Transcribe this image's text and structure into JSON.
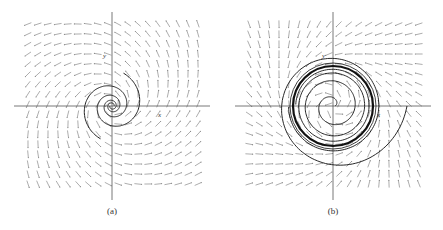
{
  "figure": {
    "panels": [
      {
        "id": "a",
        "caption": "(a)",
        "center": [
          112,
          106
        ],
        "half_size": 88,
        "axis_color": "#555555",
        "field": {
          "type": "spiral-source",
          "rotation": 1,
          "growth": 0.45,
          "grid_step": 10,
          "arrow_color": "#8a8a8a"
        },
        "trajectory_labels": [
          {
            "text": "y",
            "pos": [
              103,
              58
            ]
          },
          {
            "text": "x",
            "pos": [
              158,
              117
            ]
          }
        ],
        "curve_color": "#222222"
      },
      {
        "id": "b",
        "caption": "(b)",
        "center": [
          333,
          106
        ],
        "half_size": 88,
        "axis_color": "#555555",
        "field": {
          "type": "limit-cycle",
          "rotation": 1,
          "cycle_radius": 40,
          "grid_step": 10,
          "arrow_color": "#8a8a8a"
        },
        "trajectory_labels": [
          {
            "text": "y",
            "pos": [
              322,
              58
            ]
          },
          {
            "text": "x",
            "pos": [
              377,
              117
            ]
          }
        ],
        "curve_color": "#111111"
      }
    ]
  },
  "chart_data": [
    {
      "type": "scatter",
      "title": "(a)",
      "description": "Direction field with trajectories spiraling outward from an unstable spiral at the origin",
      "xlabel": "x",
      "ylabel": "y",
      "grid": false,
      "features": [
        "unstable spiral point at origin",
        "two outward spiral trajectories"
      ]
    },
    {
      "type": "scatter",
      "title": "(b)",
      "description": "Direction field with trajectories approaching a stable limit cycle around the origin",
      "xlabel": "x",
      "ylabel": "y",
      "grid": false,
      "features": [
        "limit cycle around origin",
        "inner trajectory spirals out to cycle",
        "outer trajectory spirals in to cycle"
      ]
    }
  ]
}
